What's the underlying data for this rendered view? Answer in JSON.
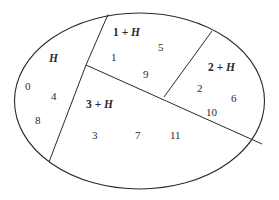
{
  "diagram": {
    "type": "partition-of-set",
    "regions": [
      {
        "label_base": "",
        "label_var": "H",
        "elements": [
          "0",
          "4",
          "8"
        ]
      },
      {
        "label_base": "1 + ",
        "label_var": "H",
        "elements": [
          "1",
          "5",
          "9"
        ]
      },
      {
        "label_base": "2 + ",
        "label_var": "H",
        "elements": [
          "2",
          "6",
          "10"
        ]
      },
      {
        "label_base": "3 + ",
        "label_var": "H",
        "elements": [
          "3",
          "7",
          "11"
        ]
      }
    ],
    "colors": {
      "stroke": "#2a2a2a",
      "background": "#ffffff"
    }
  }
}
